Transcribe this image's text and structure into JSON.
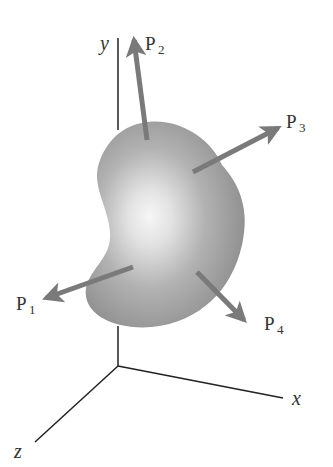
{
  "diagram": {
    "axes": {
      "x": "x",
      "y": "y",
      "z": "z"
    },
    "forces": [
      {
        "label": "P",
        "sub": "1"
      },
      {
        "label": "P",
        "sub": "2"
      },
      {
        "label": "P",
        "sub": "3"
      },
      {
        "label": "P",
        "sub": "4"
      }
    ],
    "colors": {
      "body_dark": "#8a8a8a",
      "body_light": "#f4f4f4",
      "arrow": "#7a7a7a",
      "axis": "#222222",
      "text": "#333333"
    }
  }
}
